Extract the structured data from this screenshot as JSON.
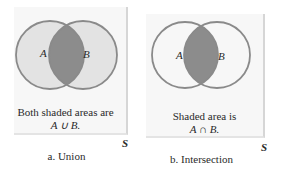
{
  "panels": [
    {
      "id": "union",
      "set_a_label": "A",
      "set_b_label": "B",
      "universe_label": "S",
      "caption_line1": "Both shaded areas are",
      "caption_line2": "A ∪ B.",
      "sublabel": "a. Union",
      "shading": "both-circles"
    },
    {
      "id": "intersection",
      "set_a_label": "A",
      "set_b_label": "B",
      "universe_label": "S",
      "caption_line1": "Shaded area is",
      "caption_line2": "A ∩ B.",
      "sublabel": "b. Intersection",
      "shading": "overlap-only"
    }
  ],
  "colors": {
    "box_fill": "#f7f7f7",
    "circle_outline": "#8a8a8a",
    "light_shade": "#e3e3e3",
    "dark_shade": "#8c8c8c",
    "text": "#2a2a2a"
  }
}
